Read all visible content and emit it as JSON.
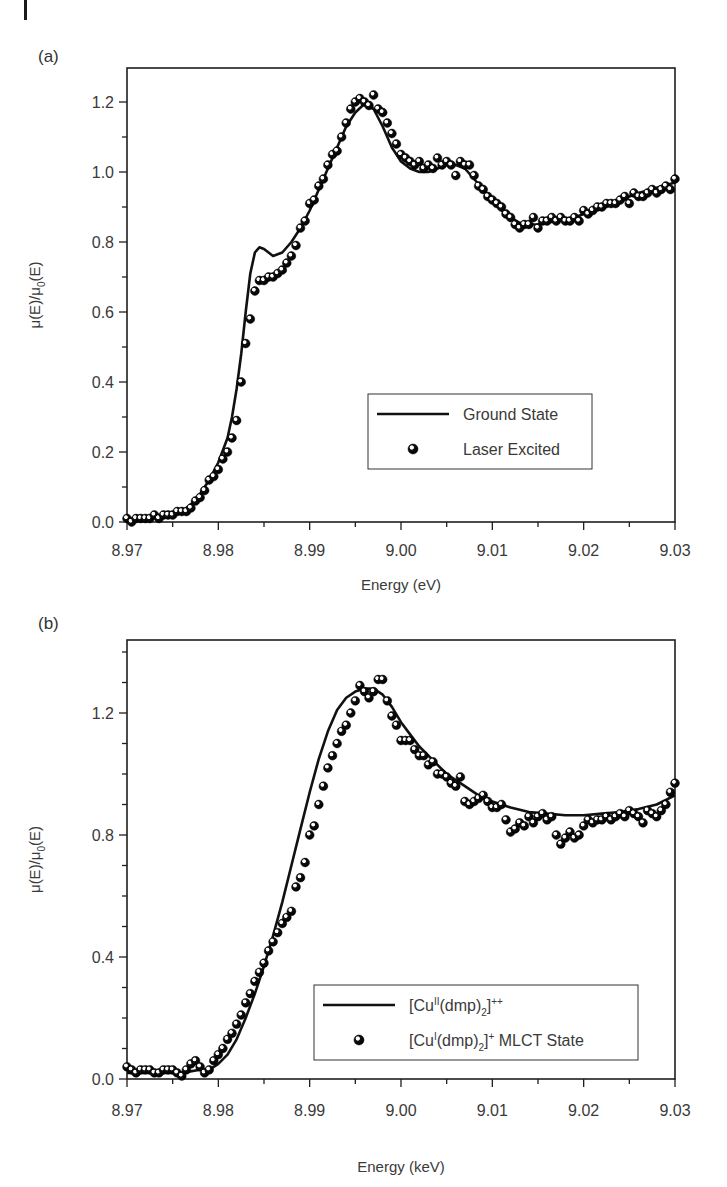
{
  "figure": {
    "panels": [
      {
        "label": "(a)"
      },
      {
        "label": "(b)"
      }
    ]
  },
  "chart_data": [
    {
      "type": "line",
      "panel": "(a)",
      "title": "",
      "xlabel": "Energy (eV)",
      "ylabel": "μ(E)/μ0(E)",
      "xlim": [
        8.97,
        9.03
      ],
      "ylim": [
        0.0,
        1.3
      ],
      "xticks": [
        8.97,
        8.98,
        8.99,
        9.0,
        9.01,
        9.02,
        9.03
      ],
      "xtick_labels": [
        "8.97",
        "8.98",
        "8.99",
        "9.00",
        "9.01",
        "9.02",
        "9.03"
      ],
      "yticks": [
        0.0,
        0.2,
        0.4,
        0.6,
        0.8,
        1.0,
        1.2
      ],
      "ytick_labels": [
        "0.0",
        "0.2",
        "0.4",
        "0.6",
        "0.8",
        "1.0",
        "1.2"
      ],
      "grid": false,
      "legend_position": "lower right",
      "legend": [
        "Ground State",
        "Laser Excited"
      ],
      "series": [
        {
          "name": "Ground State",
          "style": "line",
          "x": [
            8.97,
            8.972,
            8.974,
            8.976,
            8.977,
            8.978,
            8.979,
            8.98,
            8.981,
            8.9815,
            8.982,
            8.9825,
            8.983,
            8.9835,
            8.984,
            8.9845,
            8.985,
            8.986,
            8.987,
            8.988,
            8.989,
            8.99,
            8.991,
            8.992,
            8.993,
            8.994,
            8.995,
            8.996,
            8.997,
            8.998,
            8.999,
            9.0,
            9.001,
            9.002,
            9.003,
            9.004,
            9.005,
            9.006,
            9.007,
            9.008,
            9.009,
            9.01,
            9.011,
            9.012,
            9.013,
            9.014,
            9.015,
            9.016,
            9.017,
            9.018,
            9.019,
            9.02,
            9.022,
            9.024,
            9.026,
            9.028,
            9.03
          ],
          "y": [
            0.0,
            0.01,
            0.02,
            0.03,
            0.05,
            0.08,
            0.12,
            0.17,
            0.24,
            0.3,
            0.38,
            0.48,
            0.6,
            0.71,
            0.77,
            0.785,
            0.78,
            0.76,
            0.77,
            0.8,
            0.84,
            0.89,
            0.95,
            1.01,
            1.07,
            1.13,
            1.17,
            1.195,
            1.18,
            1.13,
            1.07,
            1.03,
            1.01,
            1.0,
            1.0,
            1.01,
            1.02,
            1.02,
            1.01,
            0.98,
            0.95,
            0.92,
            0.89,
            0.87,
            0.855,
            0.85,
            0.85,
            0.855,
            0.86,
            0.865,
            0.87,
            0.88,
            0.9,
            0.92,
            0.94,
            0.955,
            0.97
          ]
        },
        {
          "name": "Laser Excited",
          "style": "markers",
          "x": [
            8.97,
            8.9705,
            8.971,
            8.9715,
            8.972,
            8.9725,
            8.973,
            8.9735,
            8.974,
            8.9745,
            8.975,
            8.9755,
            8.976,
            8.9765,
            8.977,
            8.9775,
            8.978,
            8.9785,
            8.979,
            8.9795,
            8.98,
            8.9805,
            8.981,
            8.9815,
            8.982,
            8.9825,
            8.983,
            8.9835,
            8.984,
            8.9845,
            8.985,
            8.9855,
            8.986,
            8.9865,
            8.987,
            8.9875,
            8.988,
            8.9885,
            8.989,
            8.9895,
            8.99,
            8.9905,
            8.991,
            8.9915,
            8.992,
            8.9925,
            8.993,
            8.9935,
            8.994,
            8.9945,
            8.995,
            8.9955,
            8.996,
            8.9965,
            8.997,
            8.9975,
            8.998,
            8.9985,
            8.999,
            8.9995,
            9.0,
            9.0005,
            9.001,
            9.0015,
            9.002,
            9.0025,
            9.003,
            9.0035,
            9.004,
            9.0045,
            9.005,
            9.0055,
            9.006,
            9.0065,
            9.007,
            9.0075,
            9.008,
            9.0085,
            9.009,
            9.0095,
            9.01,
            9.0105,
            9.011,
            9.0115,
            9.012,
            9.0125,
            9.013,
            9.0135,
            9.014,
            9.0145,
            9.015,
            9.0155,
            9.016,
            9.0165,
            9.017,
            9.0175,
            9.018,
            9.0185,
            9.019,
            9.0195,
            9.02,
            9.0205,
            9.021,
            9.0215,
            9.022,
            9.0225,
            9.023,
            9.0235,
            9.024,
            9.0245,
            9.025,
            9.0255,
            9.026,
            9.0265,
            9.027,
            9.0275,
            9.028,
            9.0285,
            9.029,
            9.0295,
            9.03
          ],
          "y": [
            0.01,
            0.0,
            0.01,
            0.01,
            0.01,
            0.01,
            0.02,
            0.01,
            0.02,
            0.02,
            0.02,
            0.03,
            0.03,
            0.03,
            0.04,
            0.06,
            0.07,
            0.09,
            0.12,
            0.13,
            0.15,
            0.18,
            0.2,
            0.24,
            0.29,
            0.4,
            0.51,
            0.58,
            0.66,
            0.69,
            0.69,
            0.7,
            0.7,
            0.71,
            0.72,
            0.74,
            0.76,
            0.79,
            0.84,
            0.86,
            0.91,
            0.92,
            0.96,
            0.98,
            1.02,
            1.05,
            1.06,
            1.1,
            1.14,
            1.18,
            1.2,
            1.21,
            1.2,
            1.19,
            1.22,
            1.18,
            1.17,
            1.14,
            1.11,
            1.08,
            1.05,
            1.04,
            1.03,
            1.02,
            1.03,
            1.01,
            1.02,
            1.01,
            1.04,
            1.02,
            1.03,
            1.02,
            0.99,
            1.03,
            1.02,
            1.02,
            0.99,
            0.96,
            0.95,
            0.93,
            0.92,
            0.91,
            0.9,
            0.88,
            0.87,
            0.85,
            0.84,
            0.85,
            0.85,
            0.87,
            0.84,
            0.86,
            0.86,
            0.87,
            0.86,
            0.87,
            0.86,
            0.86,
            0.87,
            0.86,
            0.89,
            0.88,
            0.89,
            0.9,
            0.9,
            0.91,
            0.91,
            0.91,
            0.92,
            0.93,
            0.91,
            0.94,
            0.93,
            0.93,
            0.94,
            0.95,
            0.94,
            0.95,
            0.96,
            0.95,
            0.98
          ]
        }
      ]
    },
    {
      "type": "line",
      "panel": "(b)",
      "title": "",
      "xlabel": "Energy (keV)",
      "ylabel": "μ(E)/μ0(E)",
      "xlim": [
        8.97,
        9.03
      ],
      "ylim": [
        0.0,
        1.44
      ],
      "xticks": [
        8.97,
        8.98,
        8.99,
        9.0,
        9.01,
        9.02,
        9.03
      ],
      "xtick_labels": [
        "8.97",
        "8.98",
        "8.99",
        "9.00",
        "9.01",
        "9.02",
        "9.03"
      ],
      "yticks": [
        0.0,
        0.4,
        0.8,
        1.2
      ],
      "ytick_labels": [
        "0.0",
        "0.4",
        "0.8",
        "1.2"
      ],
      "grid": false,
      "legend_position": "lower right",
      "legend": [
        "[Cu^II(dmp)_2]^++",
        "[Cu^I(dmp)_2]^+ MLCT State"
      ],
      "series": [
        {
          "name": "[Cu^II(dmp)_2]^++",
          "style": "line",
          "x": [
            8.97,
            8.972,
            8.974,
            8.976,
            8.978,
            8.979,
            8.98,
            8.981,
            8.982,
            8.983,
            8.984,
            8.985,
            8.986,
            8.987,
            8.988,
            8.989,
            8.99,
            8.991,
            8.992,
            8.993,
            8.994,
            8.995,
            8.996,
            8.997,
            8.998,
            8.999,
            9.0,
            9.001,
            9.002,
            9.003,
            9.004,
            9.005,
            9.006,
            9.007,
            9.008,
            9.009,
            9.01,
            9.011,
            9.012,
            9.014,
            9.016,
            9.018,
            9.02,
            9.022,
            9.024,
            9.026,
            9.028,
            9.03
          ],
          "y": [
            0.02,
            0.02,
            0.02,
            0.02,
            0.03,
            0.03,
            0.05,
            0.08,
            0.13,
            0.2,
            0.28,
            0.37,
            0.47,
            0.58,
            0.7,
            0.82,
            0.94,
            1.05,
            1.14,
            1.21,
            1.25,
            1.27,
            1.28,
            1.28,
            1.26,
            1.22,
            1.17,
            1.13,
            1.09,
            1.06,
            1.03,
            1.0,
            0.98,
            0.96,
            0.94,
            0.92,
            0.91,
            0.9,
            0.89,
            0.875,
            0.87,
            0.865,
            0.865,
            0.87,
            0.875,
            0.885,
            0.9,
            0.93
          ]
        },
        {
          "name": "[Cu^I(dmp)_2]^+ MLCT State",
          "style": "markers",
          "x": [
            8.97,
            8.9705,
            8.971,
            8.9715,
            8.972,
            8.9725,
            8.973,
            8.9735,
            8.974,
            8.9745,
            8.975,
            8.9755,
            8.976,
            8.9765,
            8.977,
            8.9775,
            8.978,
            8.9785,
            8.979,
            8.9795,
            8.98,
            8.9805,
            8.981,
            8.9815,
            8.982,
            8.9825,
            8.983,
            8.9835,
            8.984,
            8.9845,
            8.985,
            8.9855,
            8.986,
            8.9865,
            8.987,
            8.9875,
            8.988,
            8.9885,
            8.989,
            8.9895,
            8.99,
            8.9905,
            8.991,
            8.9915,
            8.992,
            8.9925,
            8.993,
            8.9935,
            8.994,
            8.9945,
            8.995,
            8.9955,
            8.996,
            8.9965,
            8.997,
            8.9975,
            8.998,
            8.9985,
            8.999,
            8.9995,
            9.0,
            9.0005,
            9.001,
            9.0015,
            9.002,
            9.0025,
            9.003,
            9.0035,
            9.004,
            9.0045,
            9.005,
            9.0055,
            9.006,
            9.0065,
            9.007,
            9.0075,
            9.008,
            9.0085,
            9.009,
            9.0095,
            9.01,
            9.0105,
            9.011,
            9.0115,
            9.012,
            9.0125,
            9.013,
            9.0135,
            9.014,
            9.0145,
            9.015,
            9.0155,
            9.016,
            9.0165,
            9.017,
            9.0175,
            9.018,
            9.0185,
            9.019,
            9.0195,
            9.02,
            9.0205,
            9.021,
            9.0215,
            9.022,
            9.0225,
            9.023,
            9.0235,
            9.024,
            9.0245,
            9.025,
            9.0255,
            9.026,
            9.0265,
            9.027,
            9.0275,
            9.028,
            9.0285,
            9.029,
            9.0295,
            9.03
          ],
          "y": [
            0.04,
            0.03,
            0.02,
            0.03,
            0.03,
            0.03,
            0.02,
            0.02,
            0.03,
            0.03,
            0.03,
            0.02,
            0.01,
            0.03,
            0.05,
            0.06,
            0.04,
            0.02,
            0.03,
            0.06,
            0.08,
            0.1,
            0.13,
            0.15,
            0.18,
            0.21,
            0.25,
            0.28,
            0.32,
            0.35,
            0.38,
            0.42,
            0.45,
            0.48,
            0.51,
            0.53,
            0.55,
            0.63,
            0.66,
            0.71,
            0.8,
            0.83,
            0.9,
            0.96,
            1.02,
            1.06,
            1.1,
            1.14,
            1.16,
            1.2,
            1.24,
            1.29,
            1.27,
            1.25,
            1.27,
            1.31,
            1.31,
            1.24,
            1.19,
            1.16,
            1.11,
            1.11,
            1.11,
            1.08,
            1.06,
            1.06,
            1.03,
            1.04,
            1.0,
            1.0,
            0.99,
            0.97,
            0.96,
            0.99,
            0.91,
            0.9,
            0.91,
            0.92,
            0.93,
            0.91,
            0.89,
            0.89,
            0.9,
            0.85,
            0.81,
            0.82,
            0.84,
            0.83,
            0.86,
            0.84,
            0.86,
            0.87,
            0.85,
            0.86,
            0.8,
            0.77,
            0.79,
            0.81,
            0.79,
            0.8,
            0.83,
            0.85,
            0.84,
            0.85,
            0.85,
            0.86,
            0.85,
            0.86,
            0.87,
            0.86,
            0.88,
            0.87,
            0.86,
            0.84,
            0.88,
            0.87,
            0.86,
            0.88,
            0.9,
            0.94,
            0.97
          ]
        }
      ]
    }
  ]
}
